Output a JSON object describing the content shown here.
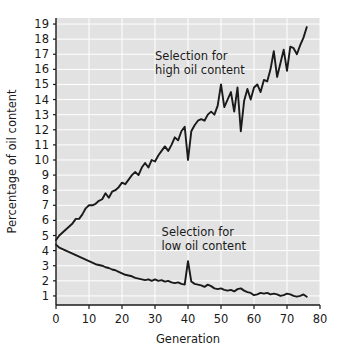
{
  "chart_data": {
    "type": "line",
    "title": "",
    "xlabel": "Generation",
    "ylabel": "Percentage of oil content",
    "xlim": [
      0,
      80
    ],
    "ylim": [
      0.4,
      19.4
    ],
    "xticks": [
      0,
      10,
      20,
      30,
      40,
      50,
      60,
      70,
      80
    ],
    "xtick_labels": [
      "0",
      "10",
      "20",
      "30",
      "40",
      "50",
      "60",
      "70",
      "80"
    ],
    "yticks": [
      1,
      2,
      3,
      4,
      5,
      6,
      7,
      8,
      9,
      10,
      11,
      12,
      13,
      14,
      15,
      16,
      17,
      18,
      19
    ],
    "ytick_labels": [
      "1",
      "2",
      "3",
      "4",
      "5",
      "6",
      "7",
      "8",
      "9",
      "10",
      "11",
      "12",
      "13",
      "14",
      "15",
      "16",
      "17",
      "18",
      "19"
    ],
    "grid": true,
    "grid_color": "#ffffff",
    "plot_background": "#e2e2e2",
    "line_color": "#1a1a1a",
    "legend_position": "none",
    "annotations": [
      {
        "text_line1": "Selection for",
        "text_line2": "high oil content",
        "x": 30,
        "y": 16.6
      },
      {
        "text_line1": "Selection for",
        "text_line2": "low oil content",
        "x": 32,
        "y": 5.0
      }
    ],
    "series": [
      {
        "name": "Selection for high oil content",
        "x": [
          0,
          1,
          2,
          3,
          4,
          5,
          6,
          7,
          8,
          9,
          10,
          11,
          12,
          13,
          14,
          15,
          16,
          17,
          18,
          19,
          20,
          21,
          22,
          23,
          24,
          25,
          26,
          27,
          28,
          29,
          30,
          31,
          32,
          33,
          34,
          35,
          36,
          37,
          38,
          39,
          40,
          41,
          42,
          43,
          44,
          45,
          46,
          47,
          48,
          49,
          50,
          51,
          52,
          53,
          54,
          55,
          56,
          57,
          58,
          59,
          60,
          61,
          62,
          63,
          64,
          65,
          66,
          67,
          68,
          69,
          70,
          71,
          72,
          73,
          74,
          75,
          76
        ],
        "values": [
          4.7,
          5.0,
          5.2,
          5.4,
          5.6,
          5.8,
          6.1,
          6.1,
          6.4,
          6.8,
          7.0,
          7.0,
          7.1,
          7.3,
          7.4,
          7.8,
          7.5,
          7.9,
          8.0,
          8.2,
          8.5,
          8.4,
          8.7,
          9.0,
          9.2,
          9.0,
          9.5,
          9.8,
          9.5,
          10.0,
          9.9,
          10.3,
          10.6,
          10.9,
          10.6,
          11.0,
          11.5,
          11.3,
          11.9,
          12.2,
          10.0,
          11.9,
          12.3,
          12.6,
          12.7,
          12.6,
          13.0,
          13.2,
          13.0,
          13.6,
          15.0,
          13.5,
          14.0,
          14.5,
          13.2,
          14.8,
          11.9,
          13.9,
          14.7,
          14.0,
          14.8,
          15.0,
          14.5,
          15.3,
          15.2,
          16.0,
          17.2,
          15.5,
          16.4,
          17.3,
          15.9,
          17.5,
          17.4,
          17.0,
          17.6,
          18.1,
          18.8
        ]
      },
      {
        "name": "Selection for low oil content",
        "x": [
          0,
          1,
          2,
          3,
          4,
          5,
          6,
          7,
          8,
          9,
          10,
          11,
          12,
          13,
          14,
          15,
          16,
          17,
          18,
          19,
          20,
          21,
          22,
          23,
          24,
          25,
          26,
          27,
          28,
          29,
          30,
          31,
          32,
          33,
          34,
          35,
          36,
          37,
          38,
          39,
          40,
          41,
          42,
          43,
          44,
          45,
          46,
          47,
          48,
          49,
          50,
          51,
          52,
          53,
          54,
          55,
          56,
          57,
          58,
          59,
          60,
          61,
          62,
          63,
          64,
          65,
          66,
          67,
          68,
          69,
          70,
          71,
          72,
          73,
          74,
          75,
          76
        ],
        "values": [
          4.4,
          4.2,
          4.1,
          4.0,
          3.9,
          3.8,
          3.7,
          3.6,
          3.5,
          3.4,
          3.3,
          3.2,
          3.1,
          3.05,
          3.0,
          2.9,
          2.85,
          2.75,
          2.7,
          2.6,
          2.5,
          2.4,
          2.35,
          2.3,
          2.2,
          2.15,
          2.1,
          2.05,
          2.1,
          2.0,
          2.1,
          2.0,
          2.05,
          1.95,
          2.0,
          1.9,
          1.85,
          1.9,
          1.8,
          1.75,
          3.3,
          1.95,
          1.8,
          1.75,
          1.7,
          1.6,
          1.75,
          1.65,
          1.5,
          1.45,
          1.5,
          1.4,
          1.35,
          1.4,
          1.3,
          1.45,
          1.5,
          1.35,
          1.25,
          1.2,
          1.05,
          1.1,
          1.2,
          1.15,
          1.2,
          1.1,
          1.15,
          1.1,
          1.0,
          1.05,
          1.15,
          1.1,
          1.0,
          0.95,
          1.0,
          1.1,
          0.95
        ]
      }
    ]
  }
}
